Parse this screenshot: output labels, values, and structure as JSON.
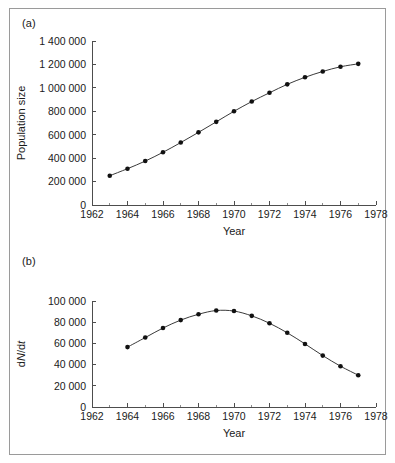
{
  "figure": {
    "panel_a_label": "(a)",
    "panel_b_label": "(b)"
  },
  "chart_data": [
    {
      "type": "line",
      "panel": "(a)",
      "title": "",
      "xlabel": "Year",
      "ylabel": "Population size",
      "xlim": [
        1962,
        1978
      ],
      "ylim": [
        0,
        1400000
      ],
      "grid": false,
      "legend": "none",
      "markers": "filled-circle",
      "x_ticks": [
        1962,
        1964,
        1966,
        1968,
        1970,
        1972,
        1974,
        1976,
        1978
      ],
      "x_tick_labels": [
        "1962",
        "1964",
        "1966",
        "1968",
        "1970",
        "1972",
        "1974",
        "1976",
        "1978"
      ],
      "x_minor_ticks": [
        1963,
        1965,
        1967,
        1969,
        1971,
        1973,
        1975,
        1977
      ],
      "y_ticks": [
        0,
        200000,
        400000,
        600000,
        800000,
        1000000,
        1200000,
        1400000
      ],
      "y_tick_labels": [
        "0",
        "200 000",
        "400 000",
        "600 000",
        "800 000",
        "1 000 000",
        "1 200 000",
        "1 400 000"
      ],
      "x": [
        1963,
        1964,
        1965,
        1966,
        1967,
        1968,
        1969,
        1970,
        1971,
        1972,
        1973,
        1974,
        1975,
        1976,
        1977
      ],
      "values": [
        250000,
        310000,
        375000,
        450000,
        533000,
        620000,
        710000,
        800000,
        883000,
        958000,
        1030000,
        1090000,
        1140000,
        1180000,
        1205000
      ]
    },
    {
      "type": "line",
      "panel": "(b)",
      "title": "",
      "xlabel": "Year",
      "ylabel": "dN/dt",
      "xlim": [
        1962,
        1978
      ],
      "ylim": [
        0,
        100000
      ],
      "grid": false,
      "legend": "none",
      "markers": "filled-circle",
      "x_ticks": [
        1962,
        1964,
        1966,
        1968,
        1970,
        1972,
        1974,
        1976,
        1978
      ],
      "x_tick_labels": [
        "1962",
        "1964",
        "1966",
        "1968",
        "1970",
        "1972",
        "1974",
        "1976",
        "1978"
      ],
      "x_minor_ticks": [
        1963,
        1965,
        1967,
        1969,
        1971,
        1973,
        1975,
        1977
      ],
      "y_ticks": [
        0,
        20000,
        40000,
        60000,
        80000,
        100000
      ],
      "y_tick_labels": [
        "0",
        "20 000",
        "40 000",
        "60 000",
        "80 000",
        "100 000"
      ],
      "x": [
        1964,
        1965,
        1966,
        1967,
        1968,
        1969,
        1970,
        1971,
        1972,
        1973,
        1974,
        1975,
        1976,
        1977
      ],
      "values": [
        56500,
        65500,
        74500,
        82000,
        87500,
        91000,
        90500,
        86000,
        79000,
        70000,
        59500,
        48500,
        38500,
        30000
      ]
    }
  ]
}
